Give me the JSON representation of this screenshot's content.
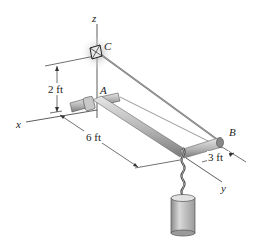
{
  "diagram": {
    "type": "3D statics figure",
    "axes": {
      "x": "x",
      "y": "y",
      "z": "z"
    },
    "points": {
      "A": "A",
      "B": "B",
      "C": "C"
    },
    "dimensions": {
      "height_C": "2 ft",
      "length_AB_x": "6 ft",
      "length_B_y": "3 ft"
    },
    "colors": {
      "pipe": "#b9b9b9",
      "cable": "#6e6e6e",
      "line": "#333333",
      "weight": "#c4c4c4"
    }
  }
}
